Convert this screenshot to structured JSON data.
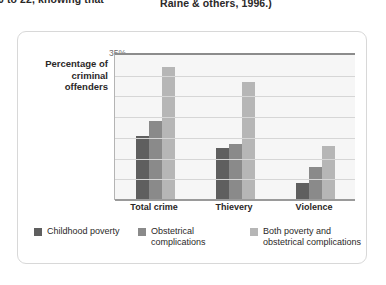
{
  "page_text": {
    "left_fragment": "0 to 22, knowing that",
    "right_fragment": "Raine & others, 1996.)"
  },
  "chart_data": {
    "type": "bar",
    "title": "",
    "xlabel": "",
    "ylabel": "Percentage of criminal offenders",
    "categories": [
      "Total crime",
      "Thievery",
      "Violence"
    ],
    "series": [
      {
        "name": "Childhood poverty",
        "color": "#5f5f5f",
        "values": [
          15.5,
          12.5,
          4
        ]
      },
      {
        "name": "Obstetrical complications",
        "color": "#8a8a8a",
        "values": [
          19,
          13.5,
          8
        ]
      },
      {
        "name": "Both poverty and obstetrical complications",
        "color": "#b6b6b6",
        "values": [
          32,
          28.5,
          13
        ]
      }
    ],
    "ylim": [
      0,
      35
    ],
    "ytick_labels": [
      "35%",
      "30",
      "25",
      "20",
      "15",
      "10",
      "5",
      "0"
    ],
    "ytick_values": [
      35,
      30,
      25,
      20,
      15,
      10,
      5,
      0
    ],
    "grid": true,
    "legend_position": "bottom"
  }
}
